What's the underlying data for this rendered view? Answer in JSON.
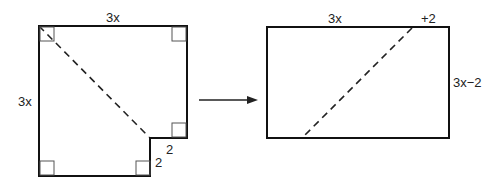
{
  "left_figure": {
    "top_label": "3x",
    "left_label": "3x",
    "step_horizontal_label": "2",
    "step_vertical_label": "2"
  },
  "right_figure": {
    "top_label": "3x",
    "top_extra_label": "+2",
    "right_label": "3x−2"
  },
  "arrow": "transform-arrow"
}
